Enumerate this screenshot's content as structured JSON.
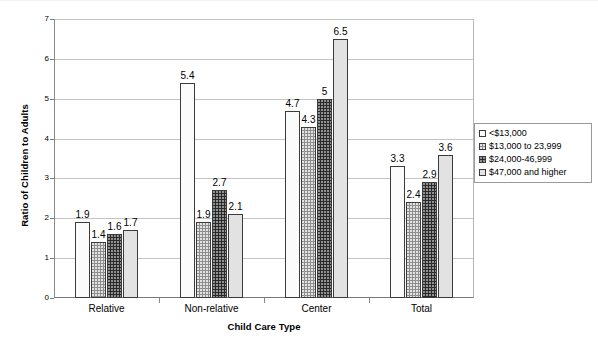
{
  "chart_data": {
    "type": "bar",
    "title": "",
    "xlabel": "Child Care Type",
    "ylabel": "Ratio of Children to Adults",
    "categories": [
      "Relative",
      "Non-relative",
      "Center",
      "Total"
    ],
    "series": [
      {
        "name": "<$13,000",
        "values": [
          1.9,
          5.4,
          4.7,
          3.3
        ]
      },
      {
        "name": "$13,000 to 23,999",
        "values": [
          1.4,
          1.9,
          4.3,
          2.4
        ]
      },
      {
        "name": "$24,000-46,999",
        "values": [
          1.6,
          2.7,
          5.0,
          2.9
        ]
      },
      {
        "name": "$47,000 and higher",
        "values": [
          1.7,
          2.1,
          6.5,
          3.6
        ]
      }
    ],
    "value_labels": [
      [
        "1.9",
        "5.4",
        "4.7",
        "3.3"
      ],
      [
        "1.4",
        "1.9",
        "4.3",
        "2.4"
      ],
      [
        "1.6",
        "2.7",
        "5",
        "2.9"
      ],
      [
        "1.7",
        "2.1",
        "6.5",
        "3.6"
      ]
    ],
    "ylim": [
      0,
      7
    ],
    "yticks": [
      0,
      1,
      2,
      3,
      4,
      5,
      6,
      7
    ],
    "ytick_labels": [
      "0",
      "1",
      "2",
      "3",
      "4",
      "5",
      "6",
      "7"
    ],
    "grid": true,
    "legend_position": "right",
    "legend_entries": [
      "<$13,000",
      "$13,000 to 23,999",
      "$24,000-46,999",
      "$47,000 and higher"
    ],
    "series_colors": [
      "#fbfbfb",
      "#8e8e8e",
      "#2a2a2a",
      "#e2e2e2"
    ]
  }
}
